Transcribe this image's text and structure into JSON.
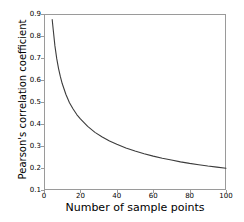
{
  "chart_data": {
    "type": "line",
    "title": "",
    "xlabel": "Number of sample points",
    "ylabel": "Pearson's correlation coefficient",
    "xlim": [
      0,
      100
    ],
    "ylim": [
      0.1,
      0.9
    ],
    "grid": false,
    "legend": null,
    "legend_position": "none",
    "line_color": "#3c3c3c",
    "axis_color": "#9a9a9a",
    "background_color": "#ffffff",
    "xticks": [
      0,
      20,
      40,
      60,
      80,
      100
    ],
    "xtick_labels": [
      "0",
      "20",
      "40",
      "60",
      "80",
      "100"
    ],
    "yticks": [
      0.1,
      0.2,
      0.3,
      0.4,
      0.5,
      0.6,
      0.7,
      0.8,
      0.9
    ],
    "ytick_labels": [
      "0.1",
      "0.2",
      "0.3",
      "0.4",
      "0.5",
      "0.6",
      "0.7",
      "0.8",
      "0.9"
    ],
    "series": [
      {
        "name": "critical Pearson's r",
        "x": [
          4.5,
          5,
          6,
          7,
          8,
          9,
          10,
          12,
          14,
          16,
          18,
          20,
          24,
          28,
          32,
          36,
          40,
          45,
          50,
          55,
          60,
          65,
          70,
          75,
          80,
          85,
          90,
          95,
          100
        ],
        "y": [
          0.875,
          0.834,
          0.755,
          0.697,
          0.652,
          0.615,
          0.584,
          0.535,
          0.497,
          0.468,
          0.443,
          0.423,
          0.389,
          0.362,
          0.341,
          0.323,
          0.308,
          0.291,
          0.277,
          0.265,
          0.254,
          0.244,
          0.236,
          0.228,
          0.221,
          0.215,
          0.209,
          0.204,
          0.199
        ]
      }
    ]
  }
}
